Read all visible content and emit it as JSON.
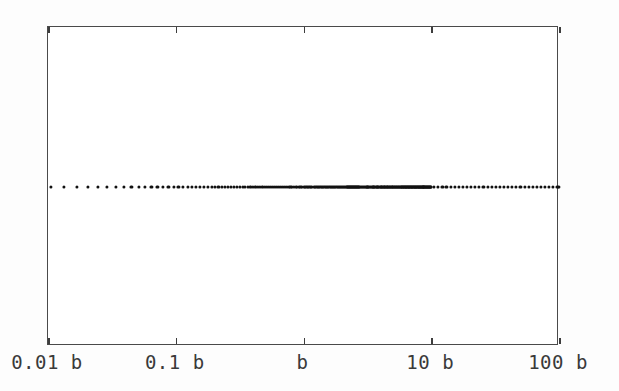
{
  "figure": {
    "background_color": "#fdfdfd",
    "plot_background_color": "#ffffff",
    "frame_color": "#4a4a4a",
    "marker_color": "#111111",
    "label_color": "#3a3a3a"
  },
  "chart_data": {
    "type": "scatter",
    "title": "",
    "subtitle": "",
    "xlabel": "",
    "ylabel": "",
    "xscale": "log",
    "xlim": [
      0.01,
      100
    ],
    "ylim": [
      0,
      1
    ],
    "grid": false,
    "legend": null,
    "legend_position": "none",
    "frame": "box",
    "tick_direction": "in",
    "tick_sides": [
      "top",
      "bottom"
    ],
    "xticks": [
      0.01,
      0.1,
      1,
      10,
      100
    ],
    "xticklabels": [
      "0.01 b",
      "0.1 b",
      "b",
      "10 b",
      "100 b"
    ],
    "yticks": [],
    "yticklabels": [],
    "marker": "circle",
    "marker_size": 3,
    "series": [
      {
        "name": "eigenvalue spectrum",
        "constant_y": 0.5,
        "note": "single horizontal row of points; density increases toward x = b and thins toward both decade extremes",
        "x": [
          0.0105,
          0.0134,
          0.0168,
          0.0205,
          0.0246,
          0.0291,
          0.034,
          0.0393,
          0.045,
          0.0511,
          0.0576,
          0.0645,
          0.0718,
          0.0795,
          0.0876,
          0.0961,
          0.105,
          0.1143,
          0.124,
          0.1341,
          0.1446,
          0.1555,
          0.1668,
          0.1785,
          0.1906,
          0.2031,
          0.216,
          0.2293,
          0.243,
          0.2571,
          0.2716,
          0.2865,
          0.3018,
          0.3175,
          0.3336,
          0.3501,
          0.367,
          0.3843,
          0.402,
          0.4201,
          0.4386,
          0.4575,
          0.4768,
          0.4965,
          0.5166,
          0.5371,
          0.558,
          0.5793,
          0.601,
          0.6231,
          0.6456,
          0.6685,
          0.6918,
          0.7155,
          0.7396,
          0.7641,
          0.789,
          0.8143,
          0.84,
          0.8661,
          0.8926,
          0.9195,
          0.9468,
          0.9745,
          1.0,
          1.0262,
          1.0543,
          1.0828,
          1.1117,
          1.141,
          1.1707,
          1.2008,
          1.2313,
          1.2622,
          1.2935,
          1.3252,
          1.3573,
          1.3898,
          1.4227,
          1.456,
          1.4897,
          1.5238,
          1.5583,
          1.5932,
          1.6285,
          1.6642,
          1.7003,
          1.7368,
          1.7737,
          1.811,
          1.8487,
          1.8868,
          1.9253,
          1.9642,
          2.0035,
          2.0432,
          2.0833,
          2.1238,
          2.1647,
          2.206,
          2.2477,
          2.2898,
          2.3323,
          2.3752,
          2.4185,
          2.4622,
          2.5063,
          2.5508,
          2.5957,
          2.641,
          2.6867,
          2.7328,
          2.7793,
          2.8262,
          2.8735,
          2.9212,
          2.9693,
          3.0178,
          3.0667,
          3.116,
          3.1657,
          3.2158,
          3.2663,
          3.3172,
          3.3685,
          3.4202,
          3.4723,
          3.5248,
          3.5777,
          3.631,
          3.6847,
          3.7388,
          3.7933,
          3.8482,
          3.9035,
          3.9592,
          4.0153,
          4.0718,
          4.1287,
          4.186,
          4.2437,
          4.3018,
          4.3603,
          4.4192,
          4.4785,
          4.5382,
          4.5983,
          4.6588,
          4.7197,
          4.781,
          4.8427,
          4.9048,
          4.9673,
          5.0302,
          5.0935,
          5.1572,
          5.2213,
          5.2858,
          5.3507,
          5.416,
          5.4817,
          5.5478,
          5.6143,
          5.6812,
          5.7485,
          5.8162,
          5.8843,
          5.9528,
          6.0217,
          6.091,
          6.1607,
          6.2308,
          6.3013,
          6.3722,
          6.4435,
          6.5152,
          6.5873,
          6.6598,
          6.7327,
          6.806,
          6.8797,
          6.9538,
          7.0283,
          7.1032,
          7.1785,
          7.2542,
          7.3303,
          7.4068,
          7.4837,
          7.561,
          7.6387,
          7.7168,
          7.7953,
          7.8742,
          7.9535,
          8.0332,
          8.1133,
          8.1938,
          8.2747,
          8.356,
          8.4377,
          8.5198,
          8.6023,
          8.6852,
          8.7685,
          8.8522,
          8.9363,
          9.0208,
          9.1057,
          9.191,
          9.2767,
          9.3628,
          9.4493,
          9.5362,
          9.6235,
          9.7112,
          9.7993,
          9.8878,
          9.9767,
          10.53,
          11.34,
          12.21,
          13.15,
          14.16,
          15.25,
          16.42,
          17.68,
          19.04,
          20.5,
          22.08,
          23.78,
          25.6,
          27.57,
          29.69,
          31.97,
          34.43,
          37.08,
          39.93,
          43.0,
          46.31,
          49.87,
          53.71,
          57.84,
          62.29,
          67.08,
          72.24,
          77.8,
          83.78,
          90.22,
          97.16,
          100.0
        ]
      }
    ]
  },
  "axis": {
    "labels": [
      {
        "value": "0.01 b",
        "tick": 0.01
      },
      {
        "value": "0.1 b",
        "tick": 0.1
      },
      {
        "value": "b",
        "tick": 1
      },
      {
        "value": "10 b",
        "tick": 10
      },
      {
        "value": "100 b",
        "tick": 100
      }
    ]
  }
}
